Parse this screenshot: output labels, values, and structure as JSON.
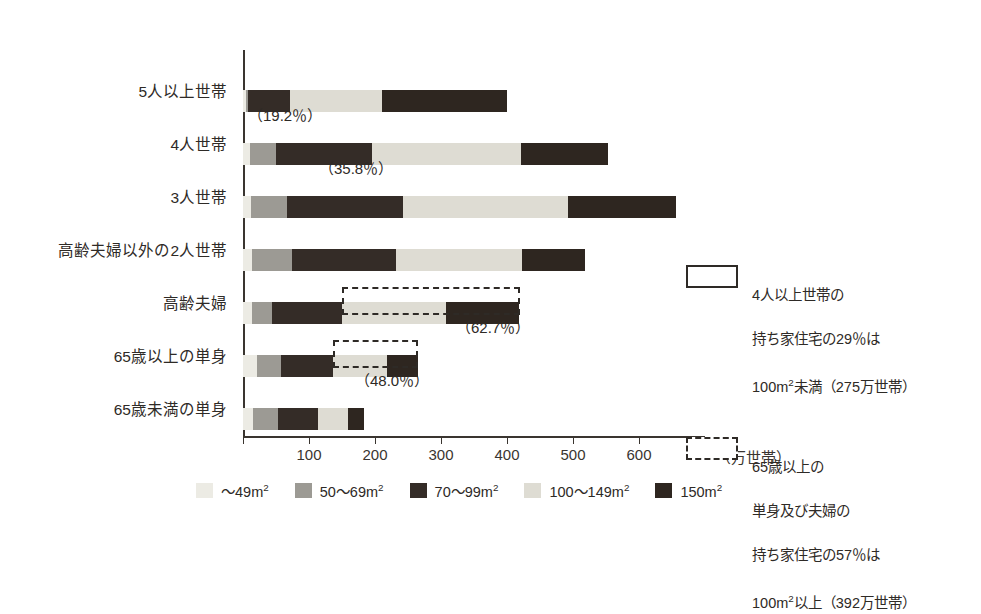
{
  "chart_data": {
    "type": "bar",
    "orientation": "horizontal",
    "stacked": true,
    "title": "",
    "xlabel": "（万世帯）",
    "ylabel": "",
    "xlim": [
      0,
      700
    ],
    "xticks": [
      0,
      100,
      200,
      300,
      400,
      500,
      600,
      700
    ],
    "xtick_labels": [
      "",
      "100",
      "200",
      "300",
      "400",
      "500",
      "600",
      "700"
    ],
    "grid": false,
    "legend_position": "bottom",
    "unit_note": "（万世帯）",
    "categories": [
      "5人以上世帯",
      "4人世帯",
      "3人世帯",
      "高齢夫婦以外の2人世帯",
      "高齢夫婦",
      "65歳以上の単身",
      "65歳未満の単身"
    ],
    "series": [
      {
        "name": "～49m2",
        "color": "#ecebe4",
        "values": [
          4,
          10,
          12,
          14,
          14,
          21,
          15
        ]
      },
      {
        "name": "50～69m2",
        "color": "#9c9a94",
        "values": [
          4,
          40,
          55,
          60,
          30,
          36,
          38
        ]
      },
      {
        "name": "70～99m2",
        "color": "#342c27",
        "values": [
          64,
          146,
          176,
          159,
          106,
          79,
          61
        ]
      },
      {
        "name": "100～149m2",
        "color": "#dedcd3",
        "values": [
          139,
          226,
          250,
          190,
          158,
          83,
          45
        ]
      },
      {
        "name": "150m2",
        "color": "#2e2620",
        "values": [
          190,
          133,
          164,
          97,
          111,
          46,
          24
        ]
      }
    ],
    "bar_annotations": [
      {
        "category": "5人以上世帯",
        "text": "（19.2％）"
      },
      {
        "category": "4人世帯",
        "text": "（35.8％）"
      },
      {
        "category": "高齢夫婦",
        "text": "（62.7％）"
      },
      {
        "category": "65歳以上の単身",
        "text": "（48.0％）"
      }
    ],
    "callouts": [
      {
        "style": "solid",
        "lines": [
          "4人以上世帯の",
          "持ち家住宅の29％は",
          "100m2未満（275万世帯）"
        ]
      },
      {
        "style": "dashed",
        "lines": [
          "65歳以上の",
          "単身及び夫婦の",
          "持ち家住宅の57％は",
          "100m2以上（392万世帯）"
        ]
      }
    ]
  },
  "axis": {
    "unit_label": "（万世帯）",
    "ticks": [
      {
        "value": 0,
        "label": ""
      },
      {
        "value": 100,
        "label": "100"
      },
      {
        "value": 200,
        "label": "200"
      },
      {
        "value": 300,
        "label": "300"
      },
      {
        "value": 400,
        "label": "400"
      },
      {
        "value": 500,
        "label": "500"
      },
      {
        "value": 600,
        "label": "600"
      },
      {
        "value": 700,
        "label": "700"
      }
    ]
  },
  "categories": [
    {
      "label": "5人以上世帯"
    },
    {
      "label": "4人世帯"
    },
    {
      "label": "3人世帯"
    },
    {
      "label": "高齢夫婦以外の2人世帯"
    },
    {
      "label": "高齢夫婦"
    },
    {
      "label": "65歳以上の単身"
    },
    {
      "label": "65歳未満の単身"
    }
  ],
  "bar_notes": [
    {
      "text": "（19.2％）"
    },
    {
      "text": "（35.8％）"
    },
    {
      "text": "（62.7％）"
    },
    {
      "text": "（48.0％）"
    }
  ],
  "legend": {
    "items": [
      {
        "label_main": "～49",
        "label_unit": "m",
        "label_sup": "2",
        "color": "#ecebe4"
      },
      {
        "label_main": "50～69",
        "label_unit": "m",
        "label_sup": "2",
        "color": "#9c9a94"
      },
      {
        "label_main": "70～99",
        "label_unit": "m",
        "label_sup": "2",
        "color": "#342c27"
      },
      {
        "label_main": "100～149",
        "label_unit": "m",
        "label_sup": "2",
        "color": "#dedcd3"
      },
      {
        "label_main": "150",
        "label_unit": "m",
        "label_sup": "2",
        "color": "#2e2620"
      }
    ]
  },
  "callouts": {
    "first": {
      "line1": "4人以上世帯の",
      "line2": "持ち家住宅の29％は",
      "line3_a": "100",
      "line3_m": "m",
      "line3_sup": "2",
      "line3_b": "未満（275万世帯）"
    },
    "second": {
      "line1": "65歳以上の",
      "line2": "単身及び夫婦の",
      "line3": "持ち家住宅の57％は",
      "line4_a": "100",
      "line4_m": "m",
      "line4_sup": "2",
      "line4_b": "以上（392万世帯）"
    }
  },
  "colors": {
    "c0": "#ecebe4",
    "c1": "#9c9a94",
    "c2": "#342c27",
    "c3": "#dedcd3",
    "c4": "#2e2620",
    "axis": "#3a3530",
    "text": "#2e2a26",
    "background": "#ffffff"
  }
}
